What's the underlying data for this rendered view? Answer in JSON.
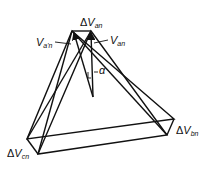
{
  "diagram": {
    "type": "phasor-diagram",
    "labels": {
      "dVan": {
        "delta": "Δ",
        "v": "V",
        "sub": "an"
      },
      "Vapn": {
        "v": "V",
        "sub": "a'n"
      },
      "Van": {
        "v": "V",
        "sub": "an"
      },
      "alpha": "α",
      "dVbn": {
        "delta": "Δ",
        "v": "V",
        "sub": "bn"
      },
      "dVcn": {
        "delta": "Δ",
        "v": "V",
        "sub": "cn"
      }
    },
    "colors": {
      "stroke": "#111111",
      "background": "#ffffff"
    }
  }
}
